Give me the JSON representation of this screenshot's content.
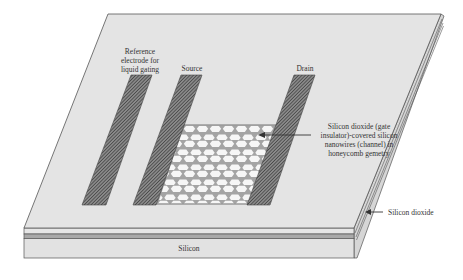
{
  "figure": {
    "colors": {
      "substrate_top": "#e4e4e4",
      "substrate_front": "#e2e2e2",
      "substrate_side": "#d8d8d8",
      "outline": "#555555",
      "oxide_band": "#a9a9a9",
      "electrode_fill": "#5a5a5a",
      "honeycomb_frame": "#a4a4a4",
      "honeycomb_cell": "#f4f4f4"
    }
  },
  "labels": {
    "reference_electrode": [
      "Reference",
      "electrode for",
      "liquid gating"
    ],
    "source": "Source",
    "drain": "Drain",
    "channel": [
      "Silicon dioxide (gate",
      "insulator)-covered silicon",
      "nanowires (channel) in",
      "honeycomb gemetry"
    ],
    "silicon_dioxide": "Silicon dioxide",
    "silicon": "Silicon"
  },
  "layers": [
    {
      "name": "Top silicon layer"
    },
    {
      "name": "Silicon dioxide"
    },
    {
      "name": "Silicon"
    }
  ],
  "components": [
    {
      "name": "Reference electrode for liquid gating"
    },
    {
      "name": "Source"
    },
    {
      "name": "Drain"
    },
    {
      "name": "Honeycomb nanowire channel"
    }
  ]
}
